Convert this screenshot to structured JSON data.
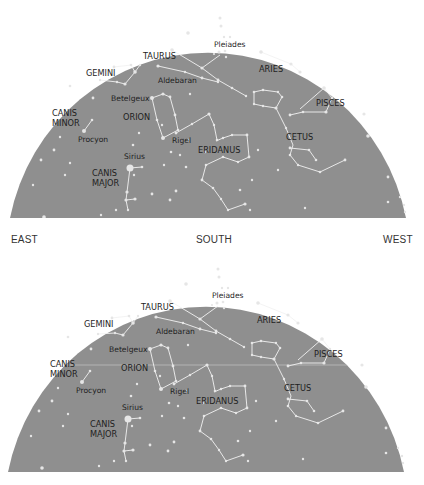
{
  "colors": {
    "sky": "#8f8f8f",
    "star": "#e6e6e6",
    "line": "#f2f2f2",
    "horizon_line": "#bdbdbd",
    "label": "#1e1e1e",
    "direction": "#333333"
  },
  "charts": [
    {
      "id": "chart-top",
      "directions": {
        "east": "EAST",
        "south": "SOUTH",
        "west": "WEST"
      },
      "labels": {
        "taurus": "TAURUS",
        "pleiades": "Pleiades",
        "aries": "ARIES",
        "gemini": "GEMINI",
        "aldebaran": "Aldebaran",
        "betelgeux": "Betelgeux",
        "pisces": "PISCES",
        "canis_minor_1": "CANIS",
        "canis_minor_2": "MINOR",
        "orion": "ORION",
        "procyon": "Procyon",
        "rigel": "Rigel",
        "eridanus": "ERIDANUS",
        "cetus": "CETUS",
        "sirius": "Sirius",
        "canis_major_1": "CANIS",
        "canis_major_2": "MAJOR"
      }
    },
    {
      "id": "chart-bottom",
      "directions": {},
      "labels": {
        "taurus": "TAURUS",
        "pleiades": "Pleiades",
        "aries": "ARIES",
        "gemini": "GEMINI",
        "aldebaran": "Aldebaran",
        "betelgeux": "Betelgeux",
        "pisces": "PISCES",
        "canis_minor_1": "CANIS",
        "canis_minor_2": "MINOR",
        "orion": "ORION",
        "procyon": "Procyon",
        "rigel": "Rigel",
        "eridanus": "ERIDANUS",
        "cetus": "CETUS",
        "sirius": "Sirius",
        "canis_major_1": "CANIS",
        "canis_major_2": "MAJOR"
      }
    }
  ]
}
